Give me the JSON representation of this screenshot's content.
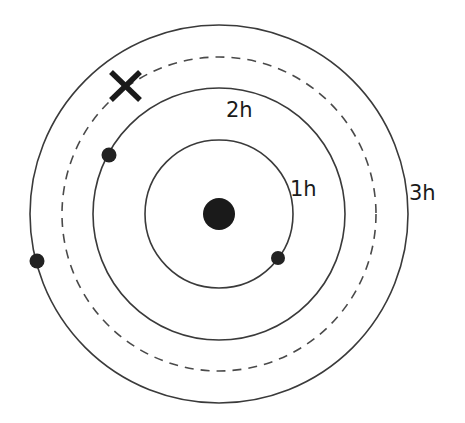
{
  "diagram": {
    "type": "orbit-diagram",
    "center": {
      "x": 219,
      "y": 214
    },
    "nucleus": {
      "r": 16,
      "color": "#1a1a1a"
    },
    "orbits": [
      {
        "id": "1h",
        "label": "1h",
        "r": 74,
        "style": "solid",
        "label_x": 290,
        "label_y": 196
      },
      {
        "id": "2h",
        "label": "2h",
        "r": 126,
        "style": "solid",
        "label_x": 227,
        "label_y": 117
      },
      {
        "id": "dashed",
        "label": "",
        "r": 157,
        "style": "dashed"
      },
      {
        "id": "3h",
        "label": "3h",
        "r": 189,
        "style": "solid",
        "label_x": 409,
        "label_y": 200
      }
    ],
    "bodies": [
      {
        "orbit": "1h",
        "x": 278,
        "y": 258,
        "r": 7
      },
      {
        "orbit": "2h",
        "x": 109,
        "y": 155,
        "r": 7.5
      },
      {
        "orbit": "3h",
        "x": 37,
        "y": 261,
        "r": 7.5
      }
    ],
    "marker": {
      "symbol": "X",
      "orbit": "dashed",
      "x": 126,
      "y": 86,
      "half_size": 15
    },
    "labels": {
      "orbit_1": "1h",
      "orbit_2": "2h",
      "orbit_3": "3h"
    },
    "colors": {
      "line": "#3a3a3a",
      "fill": "#1a1a1a",
      "background": "#ffffff"
    }
  }
}
